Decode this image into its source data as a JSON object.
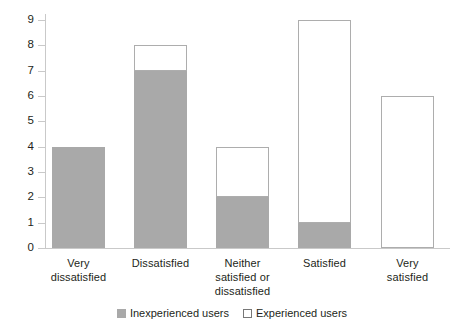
{
  "chart_data": {
    "type": "bar",
    "subtype": "stacked",
    "title": "",
    "xlabel": "",
    "ylabel": "",
    "ylim": [
      0,
      9
    ],
    "yticks": [
      "0",
      "1",
      "2",
      "3",
      "4",
      "5",
      "6",
      "7",
      "8",
      "9"
    ],
    "grid": false,
    "legend_position": "bottom-center",
    "categories": [
      "Very dissatisfied",
      "Dissatisfied",
      "Neither satisfied or dissatisfied",
      "Satisfied",
      "Very satisfied"
    ],
    "category_label_lines": [
      [
        "Very",
        "dissatisfied"
      ],
      [
        "Dissatisfied"
      ],
      [
        "Neither",
        "satisfied or",
        "dissatisfied"
      ],
      [
        "Satisfied"
      ],
      [
        "Very",
        "satisfied"
      ]
    ],
    "series": [
      {
        "name": "Inexperienced users",
        "color": "#a9a9a9",
        "values": [
          4,
          7,
          2,
          1,
          0
        ]
      },
      {
        "name": "Experienced users",
        "color": "#ffffff",
        "border_color": "#adadad",
        "values": [
          0,
          1,
          2,
          8,
          6
        ]
      }
    ],
    "totals": [
      4,
      8,
      4,
      9,
      6
    ]
  },
  "legend": {
    "items": [
      {
        "label": "Inexperienced users",
        "swatch": "filled-gray-swatch"
      },
      {
        "label": "Experienced users",
        "swatch": "outlined-white-swatch"
      }
    ]
  },
  "colors": {
    "inexperienced": "#a9a9a9",
    "experienced": "#ffffff",
    "bar_border": "#adadad",
    "axis": "#c9c9c9",
    "text": "#231f20",
    "background": "#ffffff"
  }
}
